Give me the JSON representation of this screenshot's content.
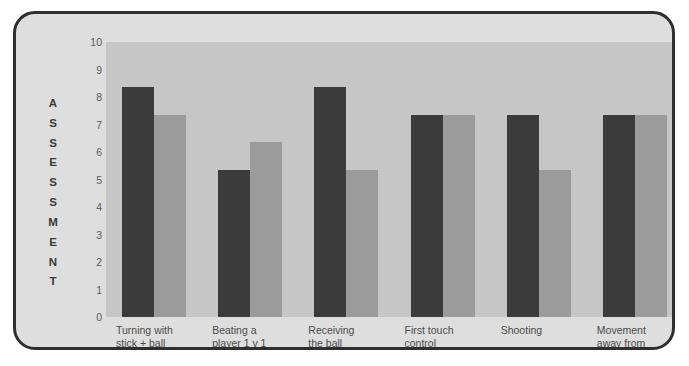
{
  "chart_data": {
    "type": "bar",
    "title": "",
    "xlabel": "",
    "ylabel": "ASSESSMENT",
    "ylim": [
      0,
      10
    ],
    "grid": false,
    "legend": "none",
    "ytick_labels": [
      "10",
      "9",
      "8",
      "7",
      "6",
      "5",
      "4",
      "3",
      "2",
      "1",
      "0"
    ],
    "categories": [
      "Turning with\nstick + ball",
      "Beating a\nplayer 1 v 1",
      "Receiving\nthe ball",
      "First touch\ncontrol",
      "Shooting",
      "Movement\naway from\nthe ball"
    ],
    "series": [
      {
        "name": "series-1",
        "color": "#3b3b3b",
        "values": [
          8.35,
          5.35,
          8.35,
          7.35,
          7.35,
          7.35
        ]
      },
      {
        "name": "series-2",
        "color": "#9b9b9b",
        "values": [
          7.35,
          6.35,
          5.35,
          7.35,
          5.35,
          7.35
        ]
      }
    ]
  },
  "ylabel_letters": [
    "A",
    "S",
    "S",
    "E",
    "S",
    "S",
    "M",
    "E",
    "N",
    "T"
  ],
  "colors": {
    "plot_background": "#c6c6c6",
    "frame_background": "#dedede",
    "frame_border": "#2f2f2f",
    "series_1": "#3b3b3b",
    "series_2": "#9b9b9b",
    "tick_text": "#5a5a5a",
    "label_text": "#4a4a4a"
  }
}
